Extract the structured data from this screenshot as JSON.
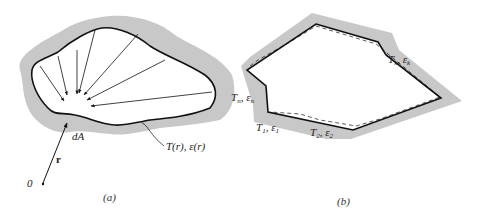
{
  "panel_a": {
    "caption": "(a)",
    "label_dA": "dA",
    "label_r": "r",
    "label_origin": "0",
    "label_surface": "T(r),  ε(r)"
  },
  "panel_b": {
    "caption": "(b)",
    "label_k": "T",
    "label_k_sub": "k",
    "label_k_eps": "ε",
    "label_n": "T",
    "label_n_sub": "n",
    "label_1": "T",
    "label_1_sub": "1",
    "label_2": "T",
    "label_2_sub": "2"
  },
  "colors": {
    "shading": "#c8c8c8",
    "line": "#111111"
  }
}
